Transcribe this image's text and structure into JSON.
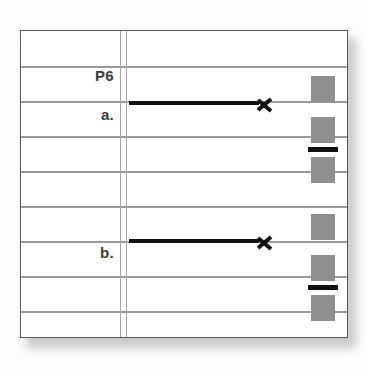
{
  "page": {
    "background_color": "#fdfdfc",
    "card_background": "#ffffff",
    "card_border_color": "#5a5a5a",
    "rule_color": "#9a9a9a",
    "margin_rule_color": "#a6a6a6",
    "block_color": "#8f8f8f",
    "ink_color": "#111111"
  },
  "margin_labels": [
    {
      "text": "P6",
      "top": 36
    },
    {
      "text": "a.",
      "top": 75
    },
    {
      "text": "b.",
      "top": 213
    }
  ],
  "rules": [
    {
      "top": 35
    },
    {
      "top": 70
    },
    {
      "top": 105
    },
    {
      "top": 140
    },
    {
      "top": 175
    },
    {
      "top": 210
    },
    {
      "top": 245
    },
    {
      "top": 280
    }
  ],
  "vertical_rules": [
    {
      "left": 99
    },
    {
      "left": 105
    }
  ],
  "groups": [
    {
      "id": "group-a",
      "label": "a.",
      "arrow": {
        "left": 108,
        "top": 62,
        "shaft_width": 130,
        "head_left": 128
      },
      "blocks": [
        {
          "left": 290,
          "top": 45
        },
        {
          "left": 290,
          "top": 86
        },
        {
          "left": 290,
          "top": 126
        }
      ],
      "bars": [
        {
          "left": 287,
          "top": 116
        }
      ]
    },
    {
      "id": "group-b",
      "label": "b.",
      "arrow": {
        "left": 108,
        "top": 200,
        "shaft_width": 130,
        "head_left": 128
      },
      "blocks": [
        {
          "left": 290,
          "top": 183
        },
        {
          "left": 290,
          "top": 224
        },
        {
          "left": 290,
          "top": 264
        }
      ],
      "bars": [
        {
          "left": 287,
          "top": 254
        }
      ]
    }
  ]
}
